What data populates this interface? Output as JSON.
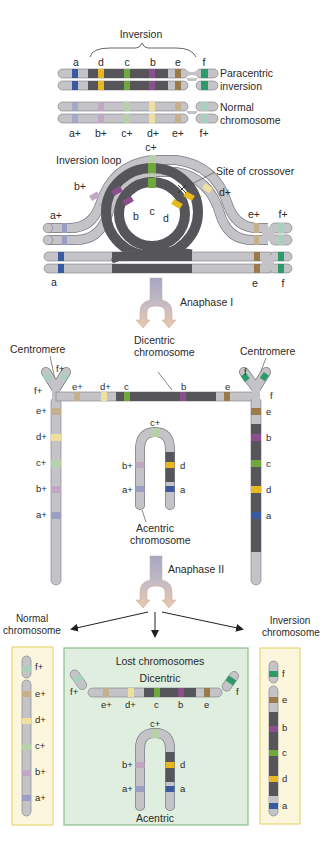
{
  "colors": {
    "chrom_light": "#c4c4c8",
    "chrom_dark": "#55555a",
    "outline": "#7a7a80",
    "a": "#3a5aa0",
    "b": "#8a4f8c",
    "c": "#6fa83c",
    "d": "#e8b820",
    "e": "#9a7a48",
    "f": "#2e9a6a",
    "a_plus": "#9a9ec4",
    "b_plus": "#c0a8c4",
    "c_plus": "#b6d0a8",
    "d_plus": "#f0e0a0",
    "e_plus": "#c4b08c",
    "f_plus": "#a8d0bc",
    "arrow_top": "#a8a8c8",
    "arrow_bottom": "#e8c4a8",
    "yellow_box_bg": "#fbf6dc",
    "yellow_box_border": "#e8d878",
    "green_box_bg": "#dfeedf",
    "green_box_border": "#8cbc8c"
  },
  "section1": {
    "inversion_label": "Inversion",
    "inv_genes": [
      "a",
      "d",
      "c",
      "b",
      "e",
      "f"
    ],
    "paracentric_label_1": "Paracentric",
    "paracentric_label_2": "inversion",
    "normal_label_1": "Normal",
    "normal_label_2": "chromosome",
    "normal_genes": [
      "a+",
      "b+",
      "c+",
      "d+",
      "e+",
      "f+"
    ]
  },
  "section2": {
    "inversion_loop_label": "Inversion loop",
    "crossover_label": "Site of crossover",
    "labels": {
      "a_plus": "a+",
      "b_plus": "b+",
      "c_plus": "c+",
      "d_plus": "d+",
      "e_plus": "e+",
      "f_plus": "f+",
      "a": "a",
      "b": "b",
      "c": "c",
      "d": "d",
      "e": "e",
      "f": "f"
    }
  },
  "arrow1": {
    "label": "Anaphase I"
  },
  "section3": {
    "centromere_left": "Centromere",
    "centromere_right": "Centromere",
    "dicentric_label_1": "Dicentric",
    "dicentric_label_2": "chromosome",
    "acentric_label_1": "Acentric",
    "acentric_label_2": "chromosome",
    "left_arm_genes": [
      "e+",
      "d+",
      "c+",
      "b+",
      "a+"
    ],
    "right_arm_genes": [
      "e",
      "b",
      "c",
      "d",
      "a"
    ],
    "top_genes": [
      "f+",
      "f+",
      "e+",
      "d+",
      "c",
      "b",
      "e",
      "f",
      "f"
    ],
    "acentric_left": [
      "b+",
      "a+"
    ],
    "acentric_right": [
      "d",
      "a"
    ],
    "acentric_top": "c+"
  },
  "arrow2": {
    "label": "Anaphase II"
  },
  "section4": {
    "normal_label_1": "Normal",
    "normal_label_2": "chromosome",
    "inversion_label_1": "Inversion",
    "inversion_label_2": "chromosome",
    "lost_label": "Lost chromosomes",
    "dicentric_label": "Dicentric",
    "acentric_label": "Acentric",
    "normal_genes": [
      "f+",
      "e+",
      "d+",
      "c+",
      "b+",
      "a+"
    ],
    "inversion_genes": [
      "f",
      "e",
      "b",
      "c",
      "d",
      "a"
    ],
    "dicentric_genes": [
      "f+",
      "e+",
      "d+",
      "c",
      "b",
      "e",
      "f"
    ],
    "acentric_left": [
      "b+",
      "a+"
    ],
    "acentric_right": [
      "d",
      "a"
    ],
    "acentric_top": "c+"
  }
}
